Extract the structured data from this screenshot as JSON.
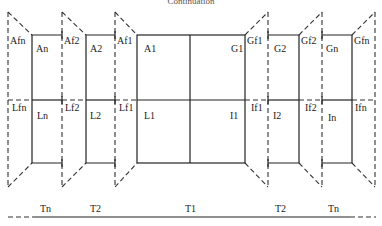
{
  "title": "Continuation",
  "colors": {
    "line": "#222222",
    "background": "#ffffff"
  },
  "top_flap_labels": [
    "Afn",
    "Af2",
    "Af1",
    "Gf1",
    "Gf2",
    "Gfn"
  ],
  "top_panel_labels": [
    "An",
    "A2",
    "A1",
    "G1",
    "G2",
    "Gn"
  ],
  "middle_flap_labels": [
    "Lfn",
    "Lf2",
    "Lf1",
    "If1",
    "If2",
    "Ifn"
  ],
  "middle_panel_labels": [
    "Ln",
    "L2",
    "L1",
    "I1",
    "I2",
    "In"
  ],
  "bottom_labels": [
    "Tn",
    "T2",
    "T1",
    "T2",
    "Tn"
  ]
}
